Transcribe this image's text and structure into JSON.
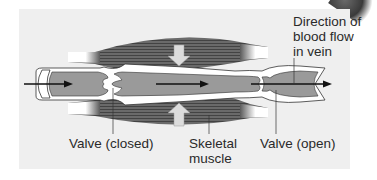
{
  "figure": {
    "type": "anatomical-diagram",
    "labels": {
      "direction": [
        "Direction of",
        "blood flow",
        "in vein"
      ],
      "valve_closed": "Valve (closed)",
      "skeletal_muscle": [
        "Skeletal",
        "muscle"
      ],
      "valve_open": "Valve (open)"
    },
    "colors": {
      "background": "#ffffff",
      "panel": "#efefef",
      "vein_lumen": "#9a9a9a",
      "vein_wall": "#ffffff",
      "muscle": "#5a5a5a",
      "compression_arrow": "#d8d8d8",
      "flow_arrow": "#111111",
      "text": "#2a2a2a"
    }
  }
}
